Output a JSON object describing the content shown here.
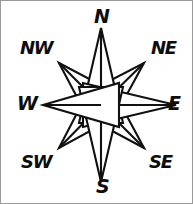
{
  "figure": {
    "name": "compass-rose",
    "style": "hand-drawn line art",
    "stroke_color": "#111111",
    "fill_color": "#ffffff",
    "background_color": "#ffffff",
    "border_color": "#9a9a9a",
    "point_count": 8
  },
  "compass": {
    "center": {
      "x": 100,
      "y": 104
    },
    "cardinal_radius": 62,
    "intercardinal_radius": 58,
    "inner_radius": 20,
    "directions": [
      {
        "abbr": "N",
        "name": "north",
        "bearing": 0,
        "type": "cardinal"
      },
      {
        "abbr": "NE",
        "name": "northeast",
        "bearing": 45,
        "type": "intercardinal"
      },
      {
        "abbr": "E",
        "name": "east",
        "bearing": 90,
        "type": "cardinal"
      },
      {
        "abbr": "SE",
        "name": "southeast",
        "bearing": 135,
        "type": "intercardinal"
      },
      {
        "abbr": "S",
        "name": "south",
        "bearing": 180,
        "type": "cardinal"
      },
      {
        "abbr": "SW",
        "name": "southwest",
        "bearing": 225,
        "type": "intercardinal"
      },
      {
        "abbr": "W",
        "name": "west",
        "bearing": 270,
        "type": "cardinal"
      },
      {
        "abbr": "NW",
        "name": "northwest",
        "bearing": 315,
        "type": "intercardinal"
      }
    ]
  },
  "labels": {
    "n": "N",
    "ne": "NE",
    "e": "E",
    "se": "SE",
    "s": "S",
    "sw": "SW",
    "w": "W",
    "nw": "NW"
  }
}
